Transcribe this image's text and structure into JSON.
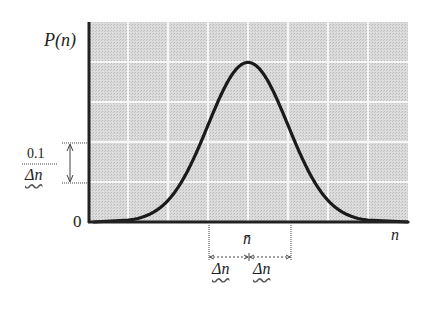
{
  "chart_data": {
    "type": "line",
    "title": "",
    "xlabel": "n",
    "ylabel": "P(n)",
    "grid": true,
    "background": "#d6d6d6",
    "grid_color": "#f4f4f4",
    "curve_color": "#1a1a1a",
    "x_units": "Δn (measured from n̄)",
    "y_units": "0.1/Δn per grid cell",
    "xlim": [
      -4,
      4
    ],
    "ylim": [
      0,
      0.5
    ],
    "x": [
      -4,
      -3.5,
      -3,
      -2.5,
      -2,
      -1.5,
      -1,
      -0.5,
      0,
      0.5,
      1,
      1.5,
      2,
      2.5,
      3,
      3.5,
      4
    ],
    "series": [
      {
        "name": "P(n)",
        "values": [
          0.0,
          0.001,
          0.004,
          0.018,
          0.054,
          0.13,
          0.242,
          0.352,
          0.399,
          0.352,
          0.242,
          0.13,
          0.054,
          0.018,
          0.004,
          0.001,
          0.0
        ]
      }
    ],
    "annotations": [
      {
        "text": "0.1/Δn",
        "meaning": "height of one grid cell (vertical double arrow)"
      },
      {
        "text": "n̄",
        "meaning": "mean, position of peak"
      },
      {
        "text": "Δn",
        "meaning": "width from n̄ - Δn to n̄"
      },
      {
        "text": "Δn",
        "meaning": "width from n̄ to n̄ + Δn"
      },
      {
        "text": "0",
        "meaning": "origin of vertical axis"
      }
    ]
  },
  "labels": {
    "y_axis": "P(n)",
    "x_axis": "n",
    "origin": "0",
    "scale_numerator": "0.1",
    "scale_denominator": "Δn",
    "mean": "n̄",
    "delta_left": "Δn",
    "delta_right": "Δn"
  }
}
